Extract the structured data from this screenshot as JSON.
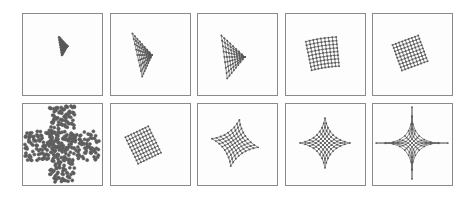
{
  "figure": {
    "rows": 2,
    "cols": 5,
    "colors": {
      "border": "#8a8a8a",
      "mesh": "#555555",
      "background": "#ffffff"
    },
    "panels": [
      {
        "id": 1,
        "row": 1,
        "col": 1,
        "state": "small dense triangular blob"
      },
      {
        "id": 2,
        "row": 1,
        "col": 2,
        "state": "triangular fan mesh"
      },
      {
        "id": 3,
        "row": 1,
        "col": 3,
        "state": "triangular fan mesh, wider"
      },
      {
        "id": 4,
        "row": 1,
        "col": 4,
        "state": "square-ish grid, slightly tilted"
      },
      {
        "id": 5,
        "row": 1,
        "col": 5,
        "state": "square-ish grid, tilted"
      },
      {
        "id": 6,
        "row": 2,
        "col": 1,
        "state": "cross-shaped scattered point cloud"
      },
      {
        "id": 7,
        "row": 2,
        "col": 2,
        "state": "rotated square grid"
      },
      {
        "id": 8,
        "row": 2,
        "col": 3,
        "state": "rotated grid, concave edges"
      },
      {
        "id": 9,
        "row": 2,
        "col": 4,
        "state": "diamond grid, concave edges"
      },
      {
        "id": 10,
        "row": 2,
        "col": 5,
        "state": "four-pointed star grid"
      }
    ]
  }
}
